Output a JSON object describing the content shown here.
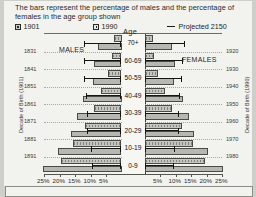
{
  "caption": "The bars represent the percentage of males and the percentage of females in the age group shown",
  "legend": [
    {
      "key": "series_1901",
      "label": "1901",
      "icon": "legend-swatch-hatched"
    },
    {
      "key": "series_1990",
      "label": "1990",
      "icon": "legend-swatch-solid"
    },
    {
      "key": "series_2150",
      "label": "Projected 2150",
      "icon": "legend-line-marker"
    }
  ],
  "labels": {
    "age_header": "Age",
    "males": "MALES",
    "females": "FEMALES",
    "left_axis_title": "Decade of Birth (1901)",
    "right_axis_title": "Decade of Birth (1990)"
  },
  "chart_data": {
    "type": "bar",
    "title": "The bars represent the percentage of males and the percentage of females in the age group shown",
    "subtitle": "",
    "orientation": "horizontal-population-pyramid",
    "xlabel": "",
    "ylabel": "Age",
    "grid": true,
    "legend_position": "top",
    "xlim_left": [
      0,
      25
    ],
    "xlim_right": [
      0,
      25
    ],
    "xticks_left": [
      "25%",
      "20%",
      "15%",
      "10%",
      "5%"
    ],
    "xticks_right": [
      "5%",
      "10%",
      "15%",
      "20%",
      "25%"
    ],
    "xtick_values_left": [
      25,
      20,
      15,
      10,
      5
    ],
    "xtick_values_right": [
      5,
      10,
      15,
      20,
      25
    ],
    "categories": [
      "70+",
      "60-69",
      "50-59",
      "40-49",
      "30-39",
      "20-29",
      "10-19",
      "0-9"
    ],
    "left_axis_ticks": [
      "1831",
      "1841",
      "1851",
      "1861",
      "1871",
      "1881",
      "1891"
    ],
    "right_axis_ticks": [
      "1920",
      "1930",
      "1940",
      "1950",
      "1960",
      "1970",
      "1980"
    ],
    "series": [
      {
        "name": "1901",
        "side": "males",
        "values": [
          2.5,
          3.0,
          4.3,
          6.5,
          8.8,
          11.8,
          15.5,
          19.5
        ]
      },
      {
        "name": "1990",
        "side": "males",
        "values": [
          7.5,
          8.8,
          9.2,
          12.5,
          14.5,
          16.2,
          20.5,
          25.2
        ]
      },
      {
        "name": "Projected 2150",
        "side": "males",
        "values": [
          12.2,
          12.0,
          12.0,
          11.5,
          11.0,
          11.0,
          9.8,
          9.5
        ]
      },
      {
        "name": "1901",
        "side": "females",
        "values": [
          2.6,
          3.2,
          4.5,
          6.6,
          9.0,
          12.0,
          15.5,
          19.5
        ]
      },
      {
        "name": "1990",
        "side": "females",
        "values": [
          8.8,
          9.8,
          9.5,
          12.5,
          14.2,
          16.0,
          20.5,
          25.2
        ]
      },
      {
        "name": "Projected 2150",
        "side": "females",
        "values": [
          13.0,
          12.5,
          12.2,
          11.5,
          11.0,
          11.0,
          9.8,
          9.5
        ]
      }
    ]
  }
}
